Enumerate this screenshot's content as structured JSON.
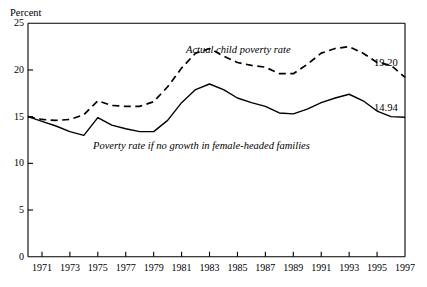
{
  "chart_data": {
    "type": "line",
    "title": "",
    "subtitle": "",
    "xlabel": "",
    "ylabel": "Percent",
    "ylim": [
      0,
      25
    ],
    "xlim": [
      1970,
      1997
    ],
    "grid": false,
    "legend_position": "inline-annotations",
    "y_ticks": [
      "0",
      "5",
      "10",
      "15",
      "20",
      "25"
    ],
    "y_tick_values": [
      0,
      5,
      10,
      15,
      20,
      25
    ],
    "x_ticks": [
      "1971",
      "1973",
      "1975",
      "1977",
      "1979",
      "1981",
      "1983",
      "1985",
      "1987",
      "1989",
      "1991",
      "1993",
      "1995",
      "1997"
    ],
    "x_tick_values": [
      1971,
      1973,
      1975,
      1977,
      1979,
      1981,
      1983,
      1985,
      1987,
      1989,
      1991,
      1993,
      1995,
      1997
    ],
    "x": [
      1970,
      1971,
      1972,
      1973,
      1974,
      1975,
      1976,
      1977,
      1978,
      1979,
      1980,
      1981,
      1982,
      1983,
      1984,
      1985,
      1986,
      1987,
      1988,
      1989,
      1990,
      1991,
      1992,
      1993,
      1994,
      1995,
      1996,
      1997
    ],
    "series": [
      {
        "name": "Actual child poverty rate",
        "style": "dashed",
        "color": "#000000",
        "end_label": "19.20",
        "values": [
          15.0,
          14.7,
          14.6,
          14.7,
          15.2,
          16.7,
          16.2,
          16.1,
          16.1,
          16.6,
          18.2,
          20.2,
          21.8,
          22.3,
          21.5,
          20.8,
          20.5,
          20.3,
          19.6,
          19.6,
          20.6,
          21.8,
          22.3,
          22.5,
          21.8,
          20.8,
          20.5,
          19.2
        ]
      },
      {
        "name": "Poverty rate if no growth in female-headed families",
        "style": "solid",
        "color": "#000000",
        "end_label": "14.94",
        "values": [
          15.0,
          14.5,
          14.0,
          13.4,
          13.0,
          14.9,
          14.1,
          13.7,
          13.4,
          13.4,
          14.6,
          16.5,
          17.9,
          18.5,
          17.9,
          17.0,
          16.5,
          16.1,
          15.4,
          15.3,
          15.8,
          16.5,
          17.0,
          17.4,
          16.7,
          15.6,
          15.0,
          14.94
        ]
      }
    ],
    "annotations": [
      {
        "text": "Actual child poverty rate",
        "series": "Actual child poverty rate"
      },
      {
        "text": "Poverty rate if no growth in female-headed families",
        "series": "Poverty rate if no growth in female-headed families"
      }
    ]
  }
}
